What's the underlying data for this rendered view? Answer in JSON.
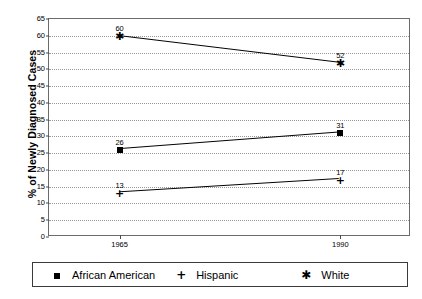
{
  "chart_data": {
    "type": "line",
    "title": "",
    "xlabel": "",
    "ylabel": "% of Newly Diagnosed Cases",
    "categories": [
      "1965",
      "1990"
    ],
    "x": [
      1965,
      1990
    ],
    "xlim": [
      1957,
      1998
    ],
    "ylim": [
      0,
      65
    ],
    "ytick_labels": [
      "0",
      "5",
      "10",
      "15",
      "20",
      "25",
      "30",
      "35",
      "40",
      "45",
      "50",
      "55",
      "60",
      "65"
    ],
    "yticks": [
      0,
      5,
      10,
      15,
      20,
      25,
      30,
      35,
      40,
      45,
      50,
      55,
      60,
      65
    ],
    "grid": true,
    "legend_position": "bottom",
    "series": [
      {
        "name": "African American",
        "marker": "filled-square",
        "values": [
          26,
          31
        ],
        "point_labels": [
          "26",
          "31"
        ]
      },
      {
        "name": "Hispanic",
        "marker": "plus",
        "values": [
          13,
          17
        ],
        "point_labels": [
          "13",
          "17"
        ]
      },
      {
        "name": "White",
        "marker": "asterisk",
        "values": [
          60,
          52
        ],
        "point_labels": [
          "60",
          "52"
        ]
      }
    ],
    "colors": {
      "line": "#000000",
      "marker": "#000000",
      "grid": "#9a9a9a",
      "axis": "#6b6b6b",
      "background": "#ffffff"
    }
  }
}
